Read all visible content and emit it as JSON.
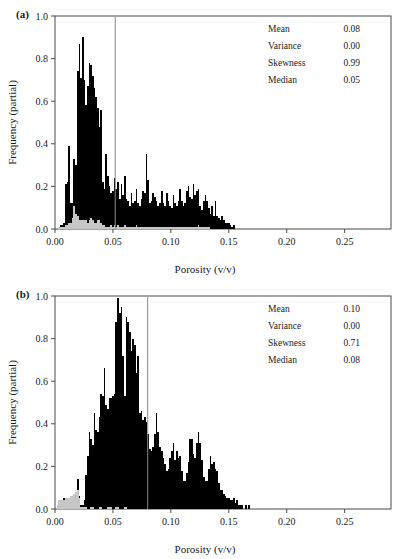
{
  "figure": {
    "panels": [
      {
        "id": "a",
        "label": "(a)",
        "xlabel": "Porosity (v/v)",
        "ylabel": "Frequency (partial)",
        "xticks": [
          "0.00",
          "0.05",
          "0.10",
          "0.15",
          "0.20",
          "0.25"
        ],
        "xtick_values": [
          0.0,
          0.05,
          0.1,
          0.15,
          0.2,
          0.25
        ],
        "yticks": [
          "0.0",
          "0.2",
          "0.4",
          "0.6",
          "0.8",
          "1.0"
        ],
        "ytick_values": [
          0.0,
          0.2,
          0.4,
          0.6,
          0.8,
          1.0
        ],
        "xlim": [
          0.0,
          0.29
        ],
        "ylim": [
          0.0,
          1.0
        ],
        "stats": [
          {
            "name": "Mean",
            "value": "0.08"
          },
          {
            "name": "Variance",
            "value": "0.00"
          },
          {
            "name": "Skewness",
            "value": "0.99"
          },
          {
            "name": "Median",
            "value": "0.05"
          }
        ],
        "median_marker": 0.052
      },
      {
        "id": "b",
        "label": "(b)",
        "xlabel": "Porosity (v/v)",
        "ylabel": "Frequency (partial)",
        "xticks": [
          "0.00",
          "0.05",
          "0.10",
          "0.15",
          "0.20",
          "0.25"
        ],
        "xtick_values": [
          0.0,
          0.05,
          0.1,
          0.15,
          0.2,
          0.25
        ],
        "yticks": [
          "0.0",
          "0.2",
          "0.4",
          "0.6",
          "0.8",
          "1.0"
        ],
        "ytick_values": [
          0.0,
          0.2,
          0.4,
          0.6,
          0.8,
          1.0
        ],
        "xlim": [
          0.0,
          0.29
        ],
        "ylim": [
          0.0,
          1.0
        ],
        "stats": [
          {
            "name": "Mean",
            "value": "0.10"
          },
          {
            "name": "Variance",
            "value": "0.00"
          },
          {
            "name": "Skewness",
            "value": "0.71"
          },
          {
            "name": "Median",
            "value": "0.08"
          }
        ],
        "median_marker": 0.08
      }
    ]
  },
  "chart_data": [
    {
      "type": "bar",
      "panel": "a",
      "title": "",
      "xlabel": "Porosity (v/v)",
      "ylabel": "Frequency (partial)",
      "xlim": [
        0.0,
        0.29
      ],
      "ylim": [
        0.0,
        1.0
      ],
      "grid": false,
      "legend": null,
      "bin_width": 0.00145,
      "x_start": 0.0,
      "series": [
        {
          "name": "total",
          "color": "#000000",
          "values": [
            0.0,
            0.0,
            0.01,
            0.02,
            0.02,
            0.03,
            0.21,
            0.22,
            0.39,
            0.12,
            0.12,
            0.33,
            0.3,
            0.74,
            0.87,
            0.71,
            0.9,
            0.7,
            0.58,
            0.67,
            0.78,
            0.77,
            0.72,
            0.66,
            0.62,
            0.57,
            0.48,
            0.56,
            0.22,
            0.19,
            0.35,
            0.25,
            0.2,
            0.17,
            0.18,
            0.24,
            0.19,
            0.22,
            0.14,
            0.21,
            0.16,
            0.25,
            0.14,
            0.13,
            0.11,
            0.17,
            0.12,
            0.13,
            0.19,
            0.12,
            0.11,
            0.14,
            0.18,
            0.17,
            0.35,
            0.23,
            0.12,
            0.13,
            0.17,
            0.15,
            0.13,
            0.11,
            0.12,
            0.18,
            0.12,
            0.11,
            0.17,
            0.13,
            0.11,
            0.1,
            0.16,
            0.12,
            0.11,
            0.13,
            0.19,
            0.13,
            0.11,
            0.12,
            0.18,
            0.2,
            0.15,
            0.14,
            0.21,
            0.16,
            0.18,
            0.19,
            0.11,
            0.09,
            0.13,
            0.16,
            0.13,
            0.1,
            0.07,
            0.11,
            0.06,
            0.13,
            0.06,
            0.05,
            0.04,
            0.06,
            0.04,
            0.03,
            0.03,
            0.03,
            0.02,
            0.01,
            0.02,
            0.0,
            0.0,
            0.0,
            0.0
          ]
        },
        {
          "name": "subset",
          "color": "#c6c6c6",
          "values": [
            0.0,
            0.0,
            0.01,
            0.01,
            0.01,
            0.01,
            0.02,
            0.02,
            0.03,
            0.03,
            0.05,
            0.11,
            0.07,
            0.06,
            0.04,
            0.04,
            0.04,
            0.04,
            0.04,
            0.03,
            0.04,
            0.05,
            0.04,
            0.03,
            0.03,
            0.04,
            0.04,
            0.03,
            0.02,
            0.02,
            0.01,
            0.01,
            0.01,
            0.02,
            0.01,
            0.02,
            0.01,
            0.02,
            0.01,
            0.01,
            0.01,
            0.02,
            0.01,
            0.01,
            0.01,
            0.01,
            0.01,
            0.01,
            0.02,
            0.01,
            0.01,
            0.01,
            0.01,
            0.01,
            0.01,
            0.01,
            0.01,
            0.01,
            0.01,
            0.01,
            0.01,
            0.01,
            0.01,
            0.01,
            0.01,
            0.01,
            0.01,
            0.01,
            0.01,
            0.01,
            0.01,
            0.01,
            0.01,
            0.01,
            0.01,
            0.01,
            0.01,
            0.01,
            0.01,
            0.01,
            0.01,
            0.01,
            0.01,
            0.01,
            0.01,
            0.02,
            0.01,
            0.01,
            0.01,
            0.01,
            0.01,
            0.01,
            0.0,
            0.0,
            0.0,
            0.0,
            0.0,
            0.0,
            0.0,
            0.0,
            0.0,
            0.0,
            0.0,
            0.0,
            0.0,
            0.0,
            0.0,
            0.0,
            0.0,
            0.0,
            0.0
          ]
        }
      ]
    },
    {
      "type": "bar",
      "panel": "b",
      "title": "",
      "xlabel": "Porosity (v/v)",
      "ylabel": "Frequency (partial)",
      "xlim": [
        0.0,
        0.29
      ],
      "ylim": [
        0.0,
        1.0
      ],
      "grid": false,
      "legend": null,
      "bin_width": 0.00145,
      "x_start": 0.0,
      "series": [
        {
          "name": "total",
          "color": "#000000",
          "values": [
            0.0,
            0.0,
            0.02,
            0.04,
            0.04,
            0.05,
            0.05,
            0.05,
            0.05,
            0.06,
            0.06,
            0.07,
            0.08,
            0.14,
            0.06,
            0.02,
            0.02,
            0.04,
            0.16,
            0.25,
            0.36,
            0.33,
            0.3,
            0.45,
            0.37,
            0.36,
            0.43,
            0.54,
            0.53,
            0.66,
            0.49,
            0.47,
            0.52,
            0.52,
            0.53,
            0.54,
            0.88,
            0.99,
            0.92,
            0.95,
            0.72,
            0.53,
            0.9,
            0.88,
            0.83,
            0.74,
            0.8,
            0.77,
            0.64,
            0.72,
            0.45,
            0.46,
            0.42,
            0.43,
            0.41,
            0.35,
            0.28,
            0.27,
            0.29,
            0.35,
            0.45,
            0.36,
            0.29,
            0.27,
            0.24,
            0.21,
            0.18,
            0.19,
            0.24,
            0.27,
            0.31,
            0.23,
            0.27,
            0.24,
            0.25,
            0.18,
            0.13,
            0.13,
            0.17,
            0.22,
            0.33,
            0.33,
            0.26,
            0.24,
            0.31,
            0.36,
            0.31,
            0.23,
            0.15,
            0.13,
            0.13,
            0.19,
            0.25,
            0.21,
            0.22,
            0.19,
            0.18,
            0.12,
            0.09,
            0.09,
            0.07,
            0.06,
            0.05,
            0.05,
            0.04,
            0.04,
            0.05,
            0.03,
            0.04,
            0.02,
            0.02,
            0.02,
            0.0,
            0.02,
            0.0,
            0.02,
            0.0
          ]
        },
        {
          "name": "subset",
          "color": "#c6c6c6",
          "values": [
            0.0,
            0.02,
            0.04,
            0.04,
            0.04,
            0.04,
            0.05,
            0.05,
            0.05,
            0.06,
            0.06,
            0.07,
            0.08,
            0.09,
            0.05,
            0.01,
            0.01,
            0.01,
            0.01,
            0.0,
            0.0,
            0.01,
            0.01,
            0.0,
            0.0,
            0.0,
            0.01,
            0.01,
            0.0,
            0.0,
            0.0,
            0.01,
            0.01,
            0.01,
            0.0,
            0.0,
            0.01,
            0.01,
            0.0,
            0.0,
            0.0,
            0.01,
            0.01,
            0.0,
            0.0,
            0.0,
            0.0,
            0.0,
            0.0,
            0.0,
            0.0,
            0.0,
            0.0,
            0.0,
            0.0,
            0.0,
            0.0,
            0.0,
            0.0,
            0.0,
            0.0,
            0.0,
            0.0,
            0.0,
            0.0,
            0.0,
            0.0,
            0.0,
            0.0,
            0.0,
            0.0,
            0.0,
            0.0,
            0.0,
            0.0,
            0.0,
            0.0,
            0.0,
            0.0,
            0.0,
            0.0,
            0.0,
            0.0,
            0.0,
            0.0,
            0.0,
            0.0,
            0.0,
            0.0,
            0.0,
            0.0,
            0.0,
            0.0,
            0.0,
            0.0,
            0.0,
            0.0,
            0.0,
            0.0,
            0.0,
            0.0,
            0.0,
            0.0,
            0.0,
            0.0,
            0.0,
            0.0,
            0.0,
            0.0,
            0.0,
            0.0,
            0.0,
            0.0,
            0.0,
            0.0,
            0.0,
            0.0
          ]
        }
      ]
    }
  ]
}
